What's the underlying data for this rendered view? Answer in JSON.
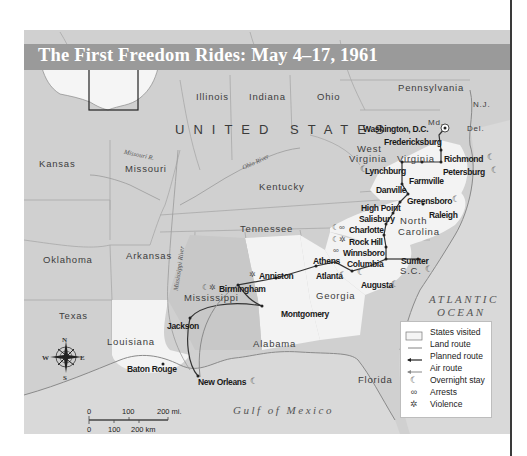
{
  "title": "The First Freedom Rides: May 4–17, 1961",
  "country_label": "UNITED STATES",
  "states": [
    {
      "name": "Illinois",
      "x": 196,
      "y": 91
    },
    {
      "name": "Indiana",
      "x": 249,
      "y": 91
    },
    {
      "name": "Ohio",
      "x": 317,
      "y": 91
    },
    {
      "name": "Pennsylvania",
      "x": 398,
      "y": 82
    },
    {
      "name": "Kansas",
      "x": 39,
      "y": 158
    },
    {
      "name": "Missouri",
      "x": 125,
      "y": 163
    },
    {
      "name": "Kentucky",
      "x": 259,
      "y": 181
    },
    {
      "name": "Tennessee",
      "x": 240,
      "y": 223
    },
    {
      "name": "Oklahoma",
      "x": 43,
      "y": 254
    },
    {
      "name": "Arkansas",
      "x": 126,
      "y": 250
    },
    {
      "name": "Mississippi",
      "x": 184,
      "y": 292
    },
    {
      "name": "Alabama",
      "x": 253,
      "y": 338
    },
    {
      "name": "Georgia",
      "x": 316,
      "y": 290
    },
    {
      "name": "Texas",
      "x": 59,
      "y": 310
    },
    {
      "name": "Louisiana",
      "x": 107,
      "y": 336
    },
    {
      "name": "Florida",
      "x": 358,
      "y": 374
    },
    {
      "name": "West",
      "x": 357,
      "y": 143
    },
    {
      "name": "Virginia",
      "x": 349,
      "y": 153
    },
    {
      "name": "Virginia",
      "x": 397,
      "y": 153
    },
    {
      "name": "North",
      "x": 400,
      "y": 215
    },
    {
      "name": "Carolina",
      "x": 398,
      "y": 226
    },
    {
      "name": "S.C.",
      "x": 400,
      "y": 265
    },
    {
      "name": "Md.",
      "x": 428,
      "y": 118
    },
    {
      "name": "Del.",
      "x": 467,
      "y": 124
    },
    {
      "name": "N.J.",
      "x": 473,
      "y": 100
    }
  ],
  "cities": [
    {
      "name": "Washington, D.C.",
      "x": 363,
      "y": 124
    },
    {
      "name": "Fredericksburg",
      "x": 384,
      "y": 137
    },
    {
      "name": "Richmond",
      "x": 444,
      "y": 154
    },
    {
      "name": "Lynchburg",
      "x": 365,
      "y": 166
    },
    {
      "name": "Petersburg",
      "x": 443,
      "y": 167
    },
    {
      "name": "Farmville",
      "x": 409,
      "y": 176
    },
    {
      "name": "Danville",
      "x": 376,
      "y": 185
    },
    {
      "name": "Greensboro",
      "x": 407,
      "y": 196
    },
    {
      "name": "Raleigh",
      "x": 429,
      "y": 210
    },
    {
      "name": "High Point",
      "x": 361,
      "y": 203
    },
    {
      "name": "Salisbury",
      "x": 359,
      "y": 214
    },
    {
      "name": "Charlotte",
      "x": 349,
      "y": 225
    },
    {
      "name": "Rock Hill",
      "x": 349,
      "y": 237
    },
    {
      "name": "Winnsboro",
      "x": 343,
      "y": 248
    },
    {
      "name": "Columbia",
      "x": 347,
      "y": 259
    },
    {
      "name": "Sumter",
      "x": 401,
      "y": 256
    },
    {
      "name": "Athens",
      "x": 313,
      "y": 256
    },
    {
      "name": "Atlanta",
      "x": 316,
      "y": 271
    },
    {
      "name": "Augusta",
      "x": 361,
      "y": 280
    },
    {
      "name": "Anniston",
      "x": 259,
      "y": 271
    },
    {
      "name": "Birmingham",
      "x": 219,
      "y": 284
    },
    {
      "name": "Montgomery",
      "x": 281,
      "y": 309
    },
    {
      "name": "Jackson",
      "x": 167,
      "y": 321
    },
    {
      "name": "Baton Rouge",
      "x": 127,
      "y": 364
    },
    {
      "name": "New Orleans",
      "x": 198,
      "y": 377
    }
  ],
  "rivers": [
    {
      "name": "Missouri R.",
      "x": 124,
      "y": 151
    },
    {
      "name": "Ohio River",
      "x": 241,
      "y": 158
    },
    {
      "name": "Mississippi River",
      "x": 176,
      "y": 280
    }
  ],
  "water": [
    {
      "name": "ATLANTIC",
      "x": 429,
      "y": 293
    },
    {
      "name": "OCEAN",
      "x": 437,
      "y": 306
    },
    {
      "name": "Gulf of Mexico",
      "x": 233,
      "y": 404
    }
  ],
  "compass": {
    "n": "N",
    "s": "S",
    "e": "E",
    "w": "W"
  },
  "scale": {
    "mi_0": "0",
    "mi_100": "100",
    "mi_200": "200 mi.",
    "km_0": "0",
    "km_100": "100",
    "km_200": "200 km"
  },
  "legend": {
    "items": [
      {
        "label": "States visited",
        "symbol": "box"
      },
      {
        "label": "Land route",
        "symbol": "line"
      },
      {
        "label": "Planned route",
        "symbol": "arrow-dark"
      },
      {
        "label": "Air route",
        "symbol": "arrow-light"
      },
      {
        "label": "Overnight stay",
        "symbol": "moon"
      },
      {
        "label": "Arrests",
        "symbol": "handcuffs"
      },
      {
        "label": "Violence",
        "symbol": "burst"
      }
    ]
  },
  "colors": {
    "land_other": "#d2d2d2",
    "states_visited": "#f2f2f2",
    "title_bar": "#9a9a9a",
    "route": "#555555",
    "planned_route": "#2a2a2a",
    "air_route": "#8a8a8a",
    "water": "#dcdcdc"
  }
}
